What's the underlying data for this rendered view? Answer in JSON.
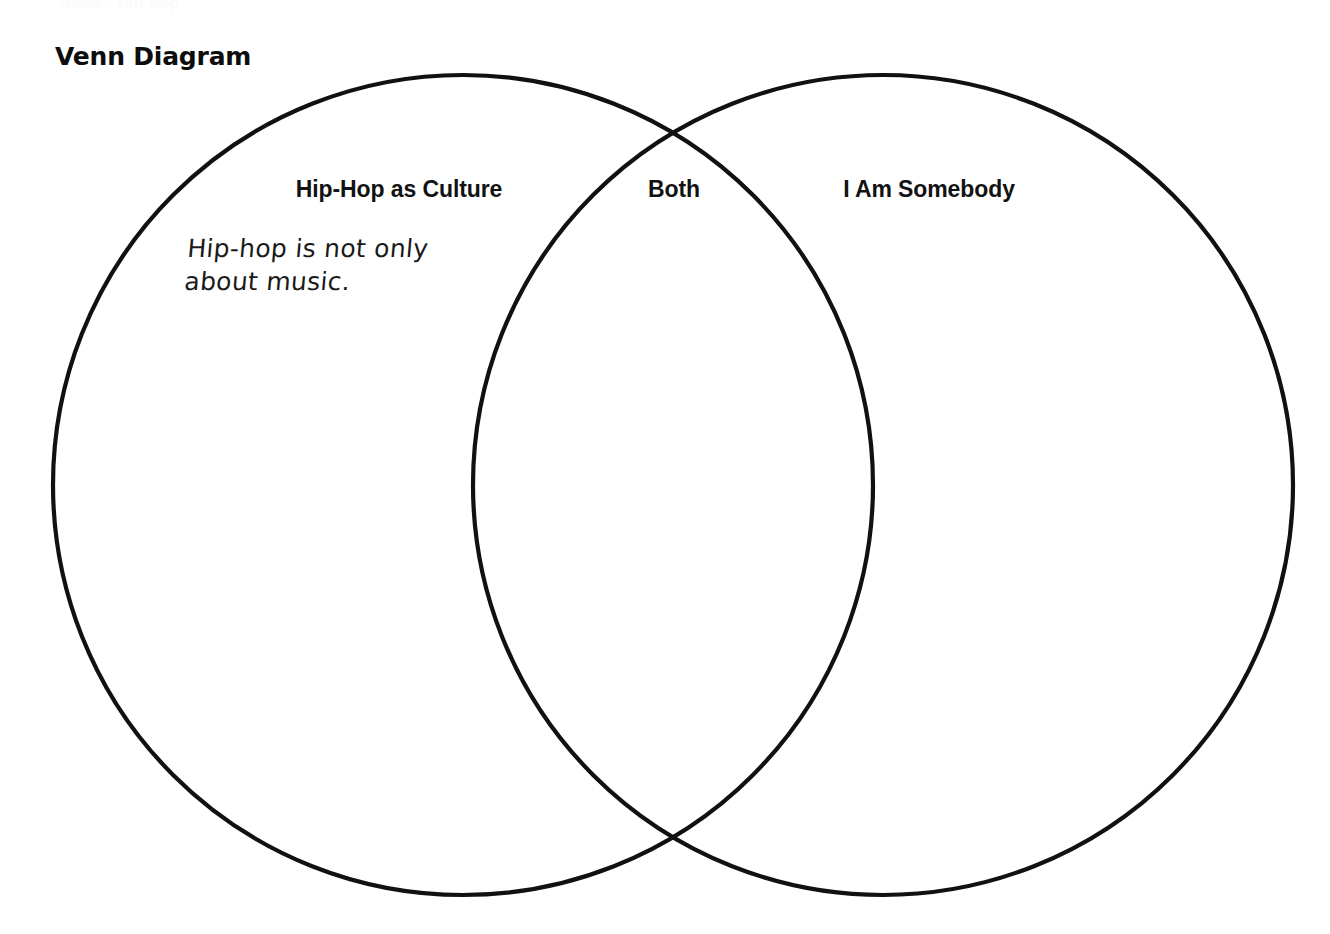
{
  "page": {
    "title": "Venn Diagram",
    "cropped_header_text": "Name · Hip-Hop"
  },
  "diagram": {
    "type": "venn-2-set",
    "left_set_label": "Hip-Hop as Culture",
    "overlap_label": "Both",
    "right_set_label": "I Am Somebody",
    "stroke_color": "#111111",
    "background_color": "#ffffff",
    "entries": {
      "left": "Hip-hop is not only\nabout music.",
      "overlap": "",
      "right": ""
    }
  }
}
